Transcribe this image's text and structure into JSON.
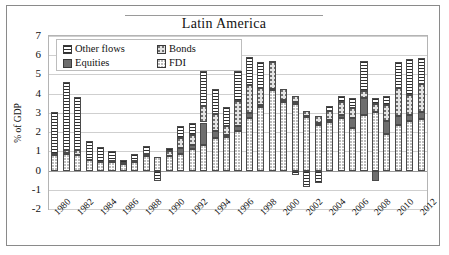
{
  "chart_data": {
    "type": "bar",
    "stacked": true,
    "title": "Latin America",
    "xlabel": "",
    "ylabel": "% of GDP",
    "ylim": [
      -2,
      7
    ],
    "yticks": [
      -2,
      -1,
      0,
      1,
      2,
      3,
      4,
      5,
      6,
      7
    ],
    "grid": true,
    "legend_position": "top-left",
    "x": [
      1980,
      1981,
      1982,
      1983,
      1984,
      1985,
      1986,
      1987,
      1988,
      1989,
      1990,
      1991,
      1992,
      1993,
      1994,
      1995,
      1996,
      1997,
      1998,
      1999,
      2000,
      2001,
      2002,
      2003,
      2004,
      2005,
      2006,
      2007,
      2008,
      2009,
      2010,
      2011,
      2012
    ],
    "categories": [
      "1980",
      "1981",
      "1982",
      "1983",
      "1984",
      "1985",
      "1986",
      "1987",
      "1988",
      "1989",
      "1990",
      "1991",
      "1992",
      "1993",
      "1994",
      "1995",
      "1996",
      "1997",
      "1998",
      "1999",
      "2000",
      "2001",
      "2002",
      "2003",
      "2004",
      "2005",
      "2006",
      "2007",
      "2008",
      "2009",
      "2010",
      "2011",
      "2012"
    ],
    "tick_labels": [
      "1980",
      "1982",
      "1984",
      "1986",
      "1988",
      "1990",
      "1992",
      "1994",
      "1996",
      "1998",
      "2000",
      "2002",
      "2004",
      "2006",
      "2008",
      "2010",
      "2012"
    ],
    "series": [
      {
        "name": "FDI",
        "pattern": "p-fdi",
        "values": [
          0.8,
          0.85,
          0.8,
          0.55,
          0.45,
          0.45,
          0.35,
          0.45,
          0.75,
          0.7,
          0.75,
          0.85,
          1.1,
          1.35,
          1.7,
          1.75,
          2.05,
          2.75,
          3.3,
          4.2,
          3.55,
          3.45,
          2.8,
          2.35,
          2.55,
          2.75,
          2.2,
          2.9,
          3.05,
          1.9,
          2.35,
          2.6,
          2.7
        ]
      },
      {
        "name": "Equities",
        "pattern": "p-equities",
        "values": [
          0.0,
          0.05,
          0.0,
          0.0,
          0.0,
          0.0,
          0.0,
          0.0,
          0.05,
          0.0,
          0.0,
          0.3,
          0.25,
          1.15,
          0.35,
          0.1,
          0.25,
          0.25,
          0.1,
          0.05,
          0.1,
          0.1,
          0.05,
          0.1,
          0.1,
          0.15,
          0.55,
          0.85,
          -0.55,
          0.7,
          0.5,
          0.3,
          0.35
        ]
      },
      {
        "name": "Bonds",
        "pattern": "p-bonds",
        "values": [
          0.05,
          0.15,
          0.25,
          0.0,
          0.0,
          0.05,
          0.05,
          0.05,
          0.05,
          0.0,
          0.25,
          0.55,
          0.5,
          0.85,
          0.9,
          0.45,
          1.3,
          1.45,
          0.9,
          1.4,
          0.6,
          0.35,
          0.25,
          0.4,
          0.45,
          0.65,
          0.5,
          0.4,
          0.4,
          0.8,
          1.45,
          1.05,
          1.45
        ]
      },
      {
        "name": "Other flows",
        "pattern": "p-other",
        "values": [
          2.2,
          3.55,
          2.8,
          1.0,
          0.75,
          0.5,
          0.15,
          0.35,
          0.45,
          -0.55,
          0.15,
          0.6,
          0.6,
          1.85,
          1.3,
          1.0,
          1.6,
          1.45,
          1.35,
          0.05,
          0.0,
          -0.25,
          -0.85,
          -0.65,
          0.25,
          0.35,
          0.5,
          1.55,
          0.35,
          0.5,
          1.35,
          1.85,
          1.35
        ]
      }
    ]
  },
  "legend": {
    "items": [
      {
        "label": "Other flows",
        "pattern": "p-other"
      },
      {
        "label": "Bonds",
        "pattern": "p-bonds"
      },
      {
        "label": "Equities",
        "pattern": "p-equities"
      },
      {
        "label": "FDI",
        "pattern": "p-fdi"
      }
    ]
  }
}
